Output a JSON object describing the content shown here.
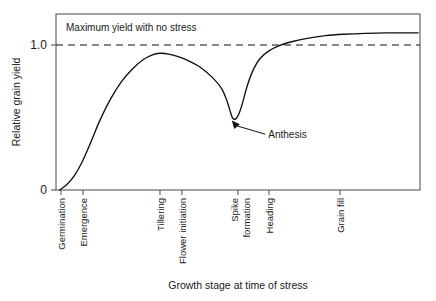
{
  "chart_data": {
    "type": "line",
    "title": "",
    "xlabel": "Growth stage at time of stress",
    "ylabel": "Relative grain yield",
    "ylim": [
      0,
      1.12
    ],
    "xlim": [
      0,
      100
    ],
    "grid": false,
    "legend": "none",
    "y_ticks": [
      {
        "value": 0,
        "label": "0"
      },
      {
        "value": 1.0,
        "label": "1.0"
      }
    ],
    "x_stages": [
      {
        "label": "Germination",
        "x": 1.5,
        "lines": [
          "Germination"
        ]
      },
      {
        "label": "Emergence",
        "x": 7.5,
        "lines": [
          "Emergence"
        ]
      },
      {
        "label": "Tillering",
        "x": 28.5,
        "lines": [
          "Tillering"
        ]
      },
      {
        "label": "Flower initiation",
        "x": 34.5,
        "lines": [
          "Flower initiation"
        ]
      },
      {
        "label": "Spike formation",
        "x": 50.0,
        "lines": [
          "Spike",
          "formation"
        ]
      },
      {
        "label": "Heading",
        "x": 58.5,
        "lines": [
          "Heading"
        ]
      },
      {
        "label": "Grain fill",
        "x": 78.0,
        "lines": [
          "Grain fill"
        ]
      }
    ],
    "reference_line": {
      "label": "Maximum yield with no stress",
      "value": 1.0,
      "style": "dashed"
    },
    "annotations": [
      {
        "label": "Anthesis",
        "point_x": 48.3,
        "point_y": 0.455,
        "text_x": 57.5,
        "text_y": 0.355
      }
    ],
    "series": [
      {
        "name": "Relative grain yield",
        "points": [
          [
            1.0,
            0.0
          ],
          [
            3.0,
            0.035
          ],
          [
            5.0,
            0.09
          ],
          [
            7.0,
            0.17
          ],
          [
            9.5,
            0.3
          ],
          [
            12.0,
            0.44
          ],
          [
            15.0,
            0.58
          ],
          [
            18.0,
            0.69
          ],
          [
            21.0,
            0.77
          ],
          [
            24.0,
            0.83
          ],
          [
            26.5,
            0.86
          ],
          [
            28.5,
            0.87
          ],
          [
            31.0,
            0.865
          ],
          [
            34.0,
            0.845
          ],
          [
            37.0,
            0.815
          ],
          [
            40.0,
            0.775
          ],
          [
            43.0,
            0.715
          ],
          [
            45.5,
            0.645
          ],
          [
            47.0,
            0.565
          ],
          [
            48.0,
            0.49
          ],
          [
            48.6,
            0.455
          ],
          [
            49.5,
            0.455
          ],
          [
            50.5,
            0.5
          ],
          [
            51.5,
            0.575
          ],
          [
            52.5,
            0.66
          ],
          [
            54.0,
            0.755
          ],
          [
            56.0,
            0.835
          ],
          [
            58.5,
            0.885
          ],
          [
            61.5,
            0.92
          ],
          [
            65.0,
            0.945
          ],
          [
            69.0,
            0.965
          ],
          [
            74.0,
            0.982
          ],
          [
            79.0,
            0.991
          ],
          [
            85.0,
            0.997
          ],
          [
            91.0,
            1.0
          ],
          [
            99.5,
            1.0
          ]
        ]
      }
    ]
  }
}
